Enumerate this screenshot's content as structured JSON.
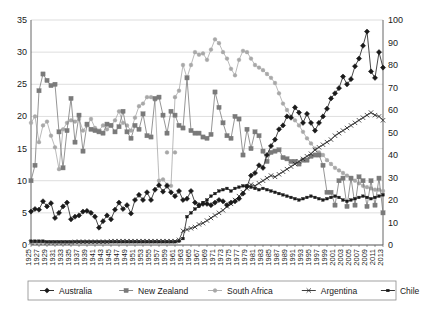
{
  "chart_data": {
    "type": "line",
    "title": "",
    "xlabel": "",
    "ylabel": "",
    "grid": true,
    "legend_position": "bottom",
    "xlim": [
      1925,
      2013
    ],
    "ylim_left": [
      0,
      35
    ],
    "ylim_right": [
      0,
      100
    ],
    "yticks_left": [
      0,
      5,
      10,
      15,
      20,
      25,
      30,
      35
    ],
    "yticks_right": [
      0,
      10,
      20,
      30,
      40,
      50,
      60,
      70,
      80,
      90,
      100
    ],
    "x": [
      1925,
      1926,
      1927,
      1928,
      1929,
      1930,
      1931,
      1932,
      1933,
      1934,
      1935,
      1936,
      1937,
      1938,
      1939,
      1940,
      1941,
      1942,
      1943,
      1944,
      1945,
      1946,
      1947,
      1948,
      1949,
      1950,
      1951,
      1952,
      1953,
      1954,
      1955,
      1956,
      1957,
      1958,
      1959,
      1960,
      1961,
      1962,
      1963,
      1964,
      1965,
      1966,
      1967,
      1968,
      1969,
      1970,
      1971,
      1972,
      1973,
      1974,
      1975,
      1976,
      1977,
      1978,
      1979,
      1980,
      1981,
      1982,
      1983,
      1984,
      1985,
      1986,
      1987,
      1988,
      1989,
      1990,
      1991,
      1992,
      1993,
      1994,
      1995,
      1996,
      1997,
      1998,
      1999,
      2000,
      2001,
      2002,
      2003,
      2004,
      2005,
      2006,
      2007,
      2008,
      2009,
      2010,
      2011,
      2012,
      2013
    ],
    "xtick_labels": [
      "1925",
      "1927",
      "1929",
      "1931",
      "1933",
      "1935",
      "1937",
      "1939",
      "1941",
      "1943",
      "1945",
      "1947",
      "1949",
      "1951",
      "1953",
      "1955",
      "1957",
      "1959",
      "1961",
      "1963",
      "1965",
      "1967",
      "1969",
      "1971",
      "1973",
      "1975",
      "1977",
      "1979",
      "1981",
      "1983",
      "1985",
      "1987",
      "1989",
      "1991",
      "1993",
      "1995",
      "1997",
      "1999",
      "2001",
      "2003",
      "2005",
      "2007",
      "2009",
      "2011",
      "2013"
    ],
    "series": [
      {
        "name": "Australia",
        "axis": "left",
        "color": "#1a1a1a",
        "marker": "diamond",
        "values": [
          5.2,
          5.6,
          5.5,
          6.8,
          6.0,
          6.5,
          4.2,
          5.0,
          6.0,
          6.6,
          4.0,
          4.4,
          4.6,
          5.2,
          5.3,
          5.0,
          4.4,
          2.7,
          3.7,
          4.6,
          4.0,
          5.5,
          6.6,
          5.6,
          6.2,
          4.9,
          7.0,
          7.8,
          7.0,
          8.2,
          7.0,
          8.6,
          9.3,
          8.3,
          9.2,
          8.2,
          7.6,
          8.4,
          7.0,
          7.2,
          8.4,
          6.6,
          6.2,
          6.4,
          6.4,
          6.2,
          6.6,
          7.0,
          6.8,
          6.2,
          6.6,
          6.8,
          7.2,
          8.0,
          9.1,
          10.8,
          11.2,
          12.4,
          12.0,
          14.0,
          15.4,
          16.4,
          18.0,
          18.6,
          20.0,
          19.8,
          21.4,
          20.6,
          19.0,
          20.4,
          19.0,
          17.8,
          19.0,
          20.0,
          21.2,
          22.8,
          23.6,
          24.4,
          26.2,
          25.0,
          25.8,
          27.8,
          29.0,
          31.0,
          33.2,
          27.0,
          26.0,
          30.0,
          27.6
        ]
      },
      {
        "name": "New Zealand",
        "axis": "left",
        "color": "#7a7a7a",
        "marker": "square",
        "values": [
          10.0,
          12.4,
          24.0,
          26.6,
          25.6,
          24.8,
          25.0,
          17.6,
          12.0,
          17.8,
          22.8,
          16.0,
          20.2,
          14.6,
          18.8,
          18.0,
          17.8,
          17.6,
          17.4,
          18.8,
          18.6,
          17.6,
          18.4,
          20.8,
          17.6,
          16.6,
          18.6,
          18.0,
          20.4,
          17.0,
          16.8,
          22.8,
          23.0,
          20.2,
          17.4,
          20.8,
          20.2,
          18.6,
          18.2,
          26.0,
          17.8,
          17.4,
          17.4,
          16.8,
          16.6,
          17.2,
          23.8,
          21.4,
          19.0,
          17.0,
          16.6,
          20.0,
          19.6,
          14.0,
          18.0,
          15.0,
          17.6,
          17.0,
          14.6,
          13.0,
          14.4,
          14.6,
          14.8,
          13.6,
          13.4,
          13.0,
          13.0,
          12.6,
          13.2,
          13.2,
          13.8,
          14.0,
          14.0,
          12.4,
          8.2,
          8.2,
          6.2,
          10.0,
          10.4,
          6.0,
          10.4,
          6.2,
          10.6,
          10.0,
          6.0,
          10.0,
          6.2,
          10.4,
          5.0
        ]
      },
      {
        "name": "South Africa",
        "axis": "left",
        "color": "#a8a8a8",
        "marker": "circle",
        "values": [
          19.0,
          20.0,
          16.0,
          18.6,
          19.2,
          17.0,
          15.2,
          11.8,
          18.0,
          19.0,
          19.4,
          19.2,
          19.6,
          17.8,
          18.6,
          19.6,
          18.2,
          17.8,
          18.6,
          18.0,
          18.6,
          19.4,
          20.8,
          19.0,
          18.6,
          17.8,
          19.8,
          21.6,
          22.0,
          23.0,
          23.0,
          22.6,
          10.0,
          10.2,
          9.4,
          9.2,
          23.0,
          24.0,
          28.0,
          26.0,
          28.0,
          30.0,
          29.6,
          29.8,
          28.8,
          30.4,
          32.0,
          31.4,
          30.0,
          29.0,
          27.4,
          26.4,
          28.8,
          30.2,
          30.0,
          29.0,
          28.0,
          27.6,
          27.2,
          26.6,
          26.0,
          25.2,
          23.6,
          22.0,
          21.0,
          20.0,
          19.4,
          18.6,
          17.6,
          16.6,
          15.8,
          15.0,
          14.4,
          14.0,
          13.2,
          12.6,
          12.0,
          11.6,
          11.2,
          10.8,
          10.4,
          10.0,
          9.6,
          9.2,
          9.0,
          8.8,
          8.6,
          8.6,
          8.4
        ]
      },
      {
        "name": "Argentina",
        "axis": "left",
        "color": "#2a2a2a",
        "marker": "x",
        "values": [
          0.4,
          0.4,
          0.4,
          0.4,
          0.4,
          0.4,
          0.4,
          0.4,
          0.4,
          0.4,
          0.4,
          0.5,
          0.5,
          0.5,
          0.5,
          0.5,
          0.5,
          0.5,
          0.5,
          0.5,
          0.6,
          0.6,
          0.6,
          0.6,
          0.6,
          0.6,
          0.6,
          0.6,
          0.6,
          0.6,
          0.6,
          0.6,
          0.6,
          0.6,
          0.6,
          0.6,
          0.6,
          0.8,
          2.2,
          2.4,
          2.6,
          2.8,
          3.2,
          3.4,
          3.8,
          4.2,
          4.6,
          5.0,
          5.4,
          6.0,
          6.4,
          7.0,
          7.6,
          8.2,
          8.8,
          9.4,
          9.2,
          9.6,
          10.0,
          10.4,
          10.8,
          10.6,
          11.0,
          11.4,
          11.8,
          12.2,
          12.6,
          13.0,
          13.4,
          13.8,
          14.2,
          14.8,
          15.2,
          15.6,
          16.0,
          16.4,
          17.0,
          17.4,
          17.8,
          18.2,
          18.6,
          19.0,
          19.4,
          19.8,
          20.2,
          20.6,
          20.2,
          20.0,
          19.4
        ]
      },
      {
        "name": "Chile",
        "axis": "left",
        "color": "#1a1a1a",
        "marker": "small-square",
        "values": [
          0.6,
          0.6,
          0.6,
          0.6,
          0.5,
          0.5,
          0.5,
          0.5,
          0.5,
          0.5,
          0.5,
          0.5,
          0.5,
          0.5,
          0.5,
          0.5,
          0.5,
          0.5,
          0.5,
          0.5,
          0.5,
          0.5,
          0.5,
          0.5,
          0.5,
          0.5,
          0.5,
          0.5,
          0.5,
          0.5,
          0.5,
          0.5,
          0.5,
          0.5,
          0.5,
          0.5,
          0.5,
          0.6,
          1.0,
          4.4,
          5.0,
          5.6,
          6.0,
          6.6,
          7.0,
          7.6,
          8.0,
          8.4,
          8.6,
          8.8,
          8.4,
          8.8,
          9.0,
          9.2,
          9.2,
          9.0,
          8.8,
          8.6,
          8.8,
          8.6,
          8.4,
          8.2,
          8.0,
          7.8,
          7.6,
          7.4,
          7.2,
          7.0,
          7.2,
          7.4,
          7.6,
          7.4,
          7.2,
          7.0,
          7.2,
          7.4,
          7.6,
          7.4,
          7.0,
          6.8,
          7.0,
          7.2,
          7.4,
          7.6,
          7.4,
          7.2,
          7.4,
          7.6,
          7.8
        ]
      }
    ],
    "scatter_points": [
      {
        "series": "South Africa",
        "x": 1959,
        "y": 14.4
      },
      {
        "series": "South Africa",
        "x": 1961,
        "y": 14.4
      }
    ]
  },
  "legend": {
    "items": [
      {
        "label": "Australia",
        "marker": "diamond",
        "color": "#1a1a1a"
      },
      {
        "label": "New Zealand",
        "marker": "square",
        "color": "#7a7a7a"
      },
      {
        "label": "South Africa",
        "marker": "circle",
        "color": "#a8a8a8"
      },
      {
        "label": "Argentina",
        "marker": "x",
        "color": "#2a2a2a"
      },
      {
        "label": "Chile",
        "marker": "small-square",
        "color": "#1a1a1a"
      }
    ]
  }
}
